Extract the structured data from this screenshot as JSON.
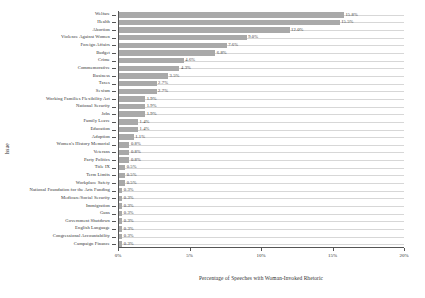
{
  "chart_data": {
    "type": "bar",
    "orientation": "horizontal",
    "title": "",
    "xlabel": "Percentage of Speeches with Woman-Invoked Rhetoric",
    "ylabel": "Issue",
    "xlim": [
      0,
      20
    ],
    "xticks": [
      0,
      5,
      10,
      15,
      20
    ],
    "xtick_labels": [
      "0%",
      "5%",
      "10%",
      "15%",
      "20%"
    ],
    "grid": true,
    "grid_axis": "y",
    "legend": "none",
    "bar_color": "#a9a9a9",
    "value_suffix": "%",
    "categories": [
      "Welfare",
      "Health",
      "Abortion",
      "Violence Against Women",
      "Foreign Affairs",
      "Budget",
      "Crime",
      "Commemorative",
      "Business",
      "Taxes",
      "Sexism",
      "Working Families Flexibility Act",
      "National Security",
      "Jobs",
      "Family Leave",
      "Education",
      "Adoption",
      "Women's History Memorial",
      "Veterans",
      "Party Politics",
      "Title IX",
      "Term Limits",
      "Workplace Safety",
      "National Foundation for the Arts Funding",
      "Medicare/Social Security",
      "Immigration",
      "Guns",
      "Government Shutdown",
      "English Language",
      "Congressional Accountability",
      "Campaign Finance"
    ],
    "values": [
      15.8,
      15.5,
      12.0,
      9.0,
      7.6,
      6.8,
      4.6,
      4.3,
      3.5,
      2.7,
      2.7,
      1.9,
      1.9,
      1.9,
      1.4,
      1.4,
      1.1,
      0.8,
      0.8,
      0.8,
      0.5,
      0.5,
      0.5,
      0.3,
      0.3,
      0.3,
      0.3,
      0.3,
      0.3,
      0.3,
      0.3
    ],
    "value_labels": [
      "15.8%",
      "15.5%",
      "12.0%",
      "9.0%",
      "7.6%",
      "6.8%",
      "4.6%",
      "4.3%",
      "3.5%",
      "2.7%",
      "2.7%",
      "1.9%",
      "1.9%",
      "1.9%",
      "1.4%",
      "1.4%",
      "1.1%",
      "0.8%",
      "0.8%",
      "0.8%",
      "0.5%",
      "0.5%",
      "0.5%",
      "0.3%",
      "0.3%",
      "0.3%",
      "0.3%",
      "0.3%",
      "0.3%",
      "0.3%",
      "0.3%"
    ]
  }
}
